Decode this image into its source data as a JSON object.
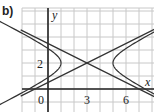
{
  "part_label": "b)",
  "colors": {
    "grid": "#c8c8c8",
    "axis": "#222222",
    "curve": "#333333"
  },
  "chart_data": {
    "type": "diagram",
    "title": "",
    "xlabel": "x",
    "ylabel": "y",
    "x_ticks": [
      {
        "value": 0,
        "label": "0"
      },
      {
        "value": 3,
        "label": "3"
      },
      {
        "value": 6,
        "label": "6"
      }
    ],
    "y_ticks": [
      {
        "value": 2,
        "label": "2"
      }
    ],
    "xlim": [
      -2,
      8.2
    ],
    "ylim": [
      -1.8,
      6.2
    ],
    "grid": true,
    "hyperbola": {
      "center": [
        3,
        2
      ],
      "a": 2,
      "b": 1,
      "equation": "(x-3)^2/4 - (y-2)^2/1 = 1",
      "vertices": [
        [
          1,
          2
        ],
        [
          5,
          2
        ]
      ]
    },
    "asymptotes": [
      {
        "equation": "y = 2 + 0.5(x-3)",
        "slope": 0.5,
        "intercept": 0.5
      },
      {
        "equation": "y = 2 - 0.5(x-3)",
        "slope": -0.5,
        "intercept": 3.5
      }
    ]
  }
}
